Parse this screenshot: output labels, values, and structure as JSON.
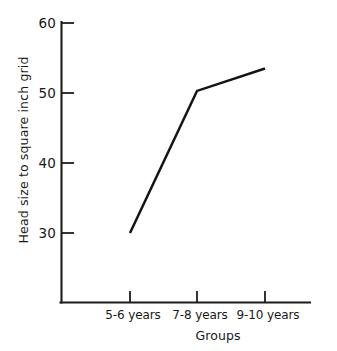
{
  "figure": {
    "background_color": "#ffffff",
    "ink_color": "#181818"
  },
  "chart_data": {
    "type": "line",
    "title": "",
    "subtitle": "",
    "xlabel": "Groups",
    "ylabel": "Head size to square inch grid",
    "categories": [
      "5-6 years",
      "7-8 years",
      "9-10 years"
    ],
    "values": [
      30,
      50.3,
      53.5
    ],
    "series": [
      {
        "name": "Head size to square inch grid",
        "values": [
          30,
          50.3,
          53.5
        ],
        "color": "#141414"
      }
    ],
    "ylim": [
      22,
      60
    ],
    "yticks": [
      30,
      40,
      50,
      60
    ],
    "ytick_labels": [
      "30",
      "40",
      "50",
      "60"
    ],
    "xtick_labels": [
      "5-6 years",
      "7-8 years",
      "9-10 years"
    ],
    "grid": false,
    "legend": false,
    "legend_position": "none",
    "annotations": []
  },
  "axes": {
    "y_tick_0": "30",
    "y_tick_1": "40",
    "y_tick_2": "50",
    "y_tick_3": "60",
    "x_cat_0": "5-6 years",
    "x_cat_1": "7-8 years",
    "x_cat_2": "9-10 years",
    "x_axis_title": "Groups",
    "y_axis_title": "Head size to square inch grid"
  }
}
